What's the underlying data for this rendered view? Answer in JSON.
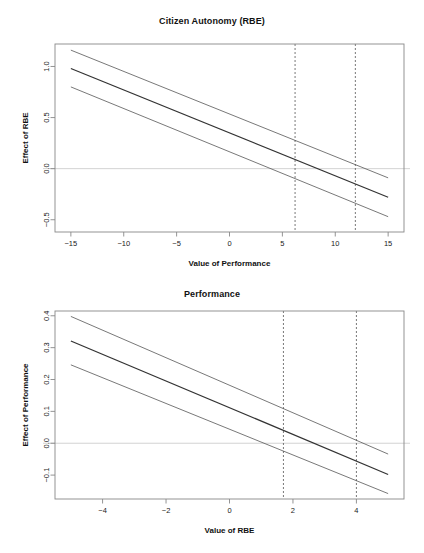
{
  "figure": {
    "background": "#ffffff",
    "line_color": "#333333",
    "ci_color": "#555555",
    "zero_line_color": "#bfbfbf",
    "marker_line_color": "#555555",
    "axis_color": "#888888"
  },
  "chart_data": [
    {
      "id": "citizen-autonomy",
      "type": "line",
      "title": "Citizen Autonomy (RBE)",
      "xlabel": "Value of Performance",
      "ylabel": "Effect of RBE",
      "xlim": [
        -16.5,
        16.5
      ],
      "ylim": [
        -0.62,
        1.22
      ],
      "xticks": [
        -15,
        -10,
        -5,
        0,
        5,
        10,
        15
      ],
      "xtick_labels": [
        "-15",
        "-10",
        "-5",
        "0",
        "5",
        "10",
        "15"
      ],
      "yticks": [
        1.0,
        0.5,
        0.0,
        -0.5
      ],
      "ytick_labels": [
        "1.0",
        "0.5",
        "0.0",
        "-0.5"
      ],
      "grid": false,
      "legend": "none",
      "zero_reference_line": 0.0,
      "vertical_markers": [
        6.2,
        11.9
      ],
      "x": [
        -15,
        15
      ],
      "series": [
        {
          "name": "upper-confidence-bound",
          "values": [
            1.16,
            -0.09
          ],
          "style": "solid-thin"
        },
        {
          "name": "marginal-effect",
          "values": [
            0.98,
            -0.28
          ],
          "style": "solid-bold"
        },
        {
          "name": "lower-confidence-bound",
          "values": [
            0.8,
            -0.47
          ],
          "style": "solid-thin"
        }
      ]
    },
    {
      "id": "performance",
      "type": "line",
      "title": "Performance",
      "xlabel": "Value of RBE",
      "ylabel": "Effect of Performance",
      "xlim": [
        -5.5,
        5.5
      ],
      "ylim": [
        -0.175,
        0.415
      ],
      "xticks": [
        -4,
        -2,
        0,
        2,
        4
      ],
      "xtick_labels": [
        "-4",
        "-2",
        "0",
        "2",
        "4"
      ],
      "yticks": [
        0.4,
        0.3,
        0.2,
        0.1,
        0.0,
        -0.1
      ],
      "ytick_labels": [
        "0.4",
        "0.3",
        "0.2",
        "0.1",
        "0.0",
        "-0.1"
      ],
      "grid": false,
      "legend": "none",
      "zero_reference_line": 0.0,
      "vertical_markers": [
        1.7,
        4.0
      ],
      "x": [
        -5,
        5
      ],
      "series": [
        {
          "name": "upper-confidence-bound",
          "values": [
            0.398,
            -0.034
          ],
          "style": "solid-thin"
        },
        {
          "name": "marginal-effect",
          "values": [
            0.321,
            -0.098
          ],
          "style": "solid-bold"
        },
        {
          "name": "lower-confidence-bound",
          "values": [
            0.246,
            -0.158
          ],
          "style": "solid-thin"
        }
      ]
    }
  ]
}
